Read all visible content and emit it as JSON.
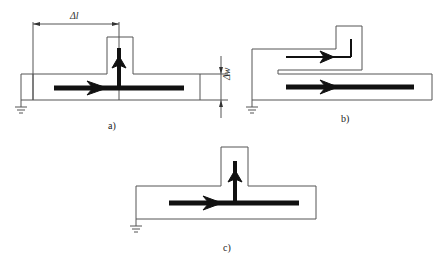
{
  "figure": {
    "panels": [
      {
        "id": "a",
        "label": "a)",
        "dimensions": {
          "length": "Δl",
          "width": "Δw"
        }
      },
      {
        "id": "b",
        "label": "b)"
      },
      {
        "id": "c",
        "label": "c)"
      }
    ],
    "colors": {
      "outline": "#555555",
      "current": "#111111",
      "background": "#ffffff"
    }
  }
}
